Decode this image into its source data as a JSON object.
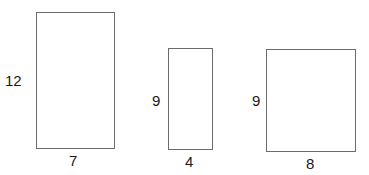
{
  "diagram": {
    "shapes": [
      {
        "name": "rectangle-1",
        "height_label": "12",
        "width_label": "7"
      },
      {
        "name": "rectangle-2",
        "height_label": "9",
        "width_label": "4"
      },
      {
        "name": "rectangle-3",
        "height_label": "9",
        "width_label": "8"
      }
    ],
    "colors": {
      "stroke": "#6b6b6b",
      "text": "#1a1a1a",
      "background": "#ffffff"
    }
  }
}
